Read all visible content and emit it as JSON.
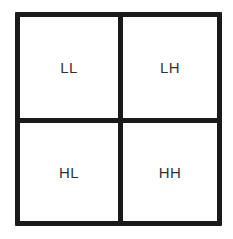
{
  "diagram": {
    "type": "2x2 subband decomposition grid",
    "cells": [
      {
        "position": "top-left",
        "label": "LL"
      },
      {
        "position": "top-right",
        "label": "LH"
      },
      {
        "position": "bottom-left",
        "label": "HL"
      },
      {
        "position": "bottom-right",
        "label": "HH"
      }
    ],
    "colors": {
      "line": "#1a1a1a",
      "text": "#333333",
      "background": "#ffffff"
    }
  }
}
